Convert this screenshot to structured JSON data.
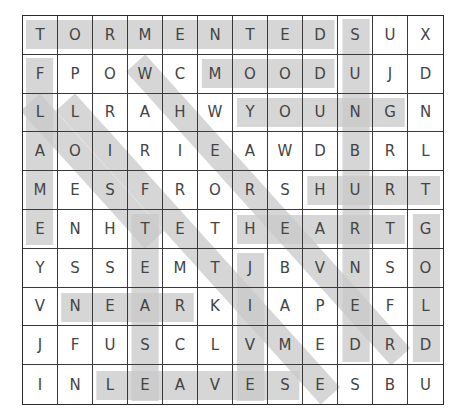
{
  "puzzle": {
    "rows": 10,
    "cols": 12,
    "grid": [
      [
        "T",
        "O",
        "R",
        "M",
        "E",
        "N",
        "T",
        "E",
        "D",
        "S",
        "U",
        "X"
      ],
      [
        "F",
        "P",
        "O",
        "W",
        "C",
        "M",
        "O",
        "O",
        "D",
        "U",
        "J",
        "D"
      ],
      [
        "L",
        "L",
        "R",
        "A",
        "H",
        "W",
        "Y",
        "O",
        "U",
        "N",
        "G",
        "N"
      ],
      [
        "A",
        "O",
        "I",
        "R",
        "I",
        "E",
        "A",
        "W",
        "D",
        "B",
        "R",
        "L"
      ],
      [
        "M",
        "E",
        "S",
        "F",
        "R",
        "O",
        "R",
        "S",
        "H",
        "U",
        "R",
        "T"
      ],
      [
        "E",
        "N",
        "H",
        "T",
        "E",
        "T",
        "H",
        "E",
        "A",
        "R",
        "T",
        "G"
      ],
      [
        "Y",
        "S",
        "S",
        "E",
        "M",
        "T",
        "J",
        "B",
        "V",
        "N",
        "S",
        "O"
      ],
      [
        "V",
        "N",
        "E",
        "A",
        "R",
        "K",
        "I",
        "A",
        "P",
        "E",
        "F",
        "L"
      ],
      [
        "J",
        "F",
        "U",
        "S",
        "C",
        "L",
        "V",
        "M",
        "E",
        "D",
        "R",
        "D"
      ],
      [
        "I",
        "N",
        "L",
        "E",
        "A",
        "V",
        "E",
        "S",
        "E",
        "S",
        "B",
        "U"
      ]
    ],
    "highlight_color": "#c8c8c8",
    "found_words": [
      {
        "word": "TORMENTED",
        "start": [
          0,
          0
        ],
        "end": [
          0,
          8
        ],
        "direction": "horizontal"
      },
      {
        "word": "MOOD",
        "start": [
          1,
          5
        ],
        "end": [
          1,
          8
        ],
        "direction": "horizontal"
      },
      {
        "word": "YOUNG",
        "start": [
          2,
          6
        ],
        "end": [
          2,
          10
        ],
        "direction": "horizontal"
      },
      {
        "word": "HURT",
        "start": [
          4,
          8
        ],
        "end": [
          4,
          11
        ],
        "direction": "horizontal"
      },
      {
        "word": "HEART",
        "start": [
          5,
          6
        ],
        "end": [
          5,
          10
        ],
        "direction": "horizontal"
      },
      {
        "word": "NEAR",
        "start": [
          7,
          1
        ],
        "end": [
          7,
          4
        ],
        "direction": "horizontal"
      },
      {
        "word": "LEAVES",
        "start": [
          9,
          2
        ],
        "end": [
          9,
          7
        ],
        "direction": "horizontal"
      },
      {
        "word": "FLAME",
        "start": [
          1,
          0
        ],
        "end": [
          5,
          0
        ],
        "direction": "vertical"
      },
      {
        "word": "SUNBURNED",
        "start": [
          0,
          9
        ],
        "end": [
          8,
          9
        ],
        "direction": "vertical"
      },
      {
        "word": "TEASE",
        "start": [
          5,
          3
        ],
        "end": [
          9,
          3
        ],
        "direction": "vertical"
      },
      {
        "word": "JIVE",
        "start": [
          6,
          6
        ],
        "end": [
          9,
          6
        ],
        "direction": "vertical"
      },
      {
        "word": "GOLD",
        "start": [
          5,
          11
        ],
        "end": [
          8,
          11
        ],
        "direction": "vertical"
      },
      {
        "word": "LOST",
        "start": [
          2,
          0
        ],
        "end": [
          5,
          3
        ],
        "direction": "diagonal"
      },
      {
        "word": "LIFETIME",
        "start": [
          2,
          1
        ],
        "end": [
          9,
          8
        ],
        "direction": "diagonal"
      },
      {
        "word": "WHEREVER",
        "start": [
          1,
          3
        ],
        "end": [
          8,
          10
        ],
        "direction": "diagonal"
      }
    ]
  }
}
